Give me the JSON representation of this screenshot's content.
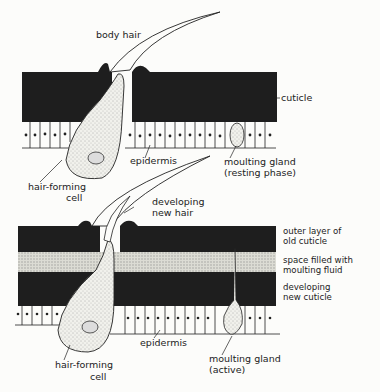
{
  "diagram": {
    "colors": {
      "cuticle": "#1e1e1e",
      "cell": "#eeeeea",
      "fluid": "#d9d9d2",
      "ink": "#222222",
      "paper": "#fcfcfa"
    },
    "panels": [
      {
        "id": "resting",
        "labels": {
          "body_hair": "body hair",
          "cuticle": "cuticle",
          "epidermis": "epidermis",
          "hair_forming_cell_1": "hair-forming",
          "hair_forming_cell_2": "cell",
          "moulting_gland_1": "moulting gland",
          "moulting_gland_2": "(resting phase)"
        }
      },
      {
        "id": "active",
        "labels": {
          "developing_new_hair_1": "developing",
          "developing_new_hair_2": "new hair",
          "outer_layer_1": "outer layer of",
          "outer_layer_2": "old cuticle",
          "space_fluid_1": "space filled with",
          "space_fluid_2": "moulting fluid",
          "new_cuticle_1": "developing",
          "new_cuticle_2": "new cuticle",
          "epidermis": "epidermis",
          "hair_forming_cell_1": "hair-forming",
          "hair_forming_cell_2": "cell",
          "moulting_gland_1": "moulting gland",
          "moulting_gland_2": "(active)"
        }
      }
    ]
  }
}
